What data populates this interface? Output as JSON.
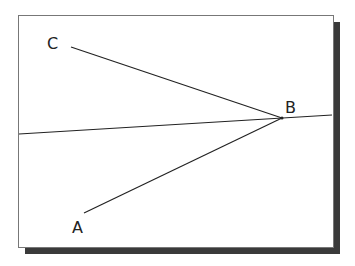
{
  "diagram": {
    "points": {
      "A": {
        "label": "A",
        "x": 84,
        "y": 213
      },
      "B": {
        "label": "B",
        "x": 282,
        "y": 118
      },
      "C": {
        "label": "C",
        "x": 71,
        "y": 47
      }
    },
    "segments": [
      {
        "from": "B",
        "to": "A"
      },
      {
        "from": "B",
        "to": "C"
      }
    ],
    "line": {
      "x1": 19,
      "y1": 134,
      "x2": 332,
      "y2": 115
    },
    "colors": {
      "stroke": "#222222",
      "background": "#ffffff",
      "shadow": "#3a3a3a"
    }
  }
}
